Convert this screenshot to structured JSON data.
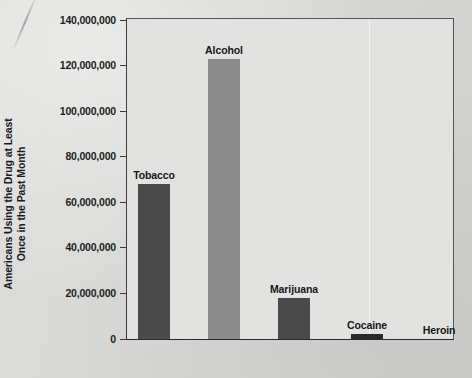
{
  "chart_data": {
    "type": "bar",
    "title": "",
    "subtitle": "",
    "xlabel": "",
    "ylabel": "Americans Using the Drug at Least Once in the Past Month",
    "ylabel_lines": [
      "Americans Using the Drug at Least",
      "Once in the Past Month"
    ],
    "categories": [
      "Tobacco",
      "Alcohol",
      "Marijuana",
      "Cocaine",
      "Heroin"
    ],
    "values": [
      68000000,
      123000000,
      18000000,
      2000000,
      0
    ],
    "ylim": [
      0,
      140000000
    ],
    "ytick_values": [
      0,
      20000000,
      40000000,
      60000000,
      80000000,
      100000000,
      120000000,
      140000000
    ],
    "ytick_labels": [
      "0",
      "20,000,000",
      "40,000,000",
      "60,000,000",
      "80,000,000",
      "100,000,000",
      "120,000,000",
      "140,000,000"
    ],
    "grid": false,
    "legend": "none",
    "bar_colors": [
      "#4a4a4a",
      "#8b8b8b",
      "#4a4a4a",
      "#2a2a2a",
      "#2a2a2a"
    ],
    "data_labels_position": "above-bar"
  },
  "figure": {
    "background_color": "#d8d8d6",
    "plot_background_color": "#e2e2e0",
    "axis_color": "#3a3a3a",
    "text_color": "#1b1b1b"
  }
}
